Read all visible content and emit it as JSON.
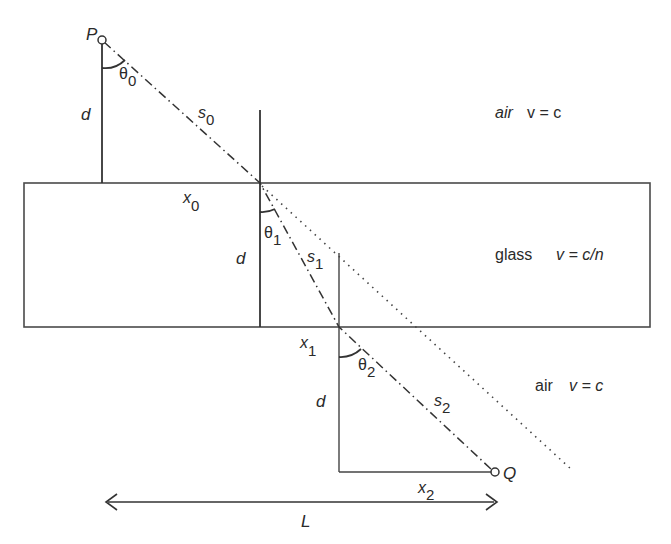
{
  "figure": {
    "points": {
      "source": "P",
      "destination": "Q"
    },
    "regions": [
      {
        "name": "air",
        "velocity": "v = c",
        "position": "top"
      },
      {
        "name": "glass",
        "velocity": "v = c/n",
        "position": "middle"
      },
      {
        "name": "air",
        "velocity": "v = c",
        "position": "bottom"
      }
    ],
    "angles": {
      "theta0": {
        "symbol": "θ",
        "sub": "0"
      },
      "theta1": {
        "symbol": "θ",
        "sub": "1"
      },
      "theta2": {
        "symbol": "θ",
        "sub": "2"
      }
    },
    "segments": {
      "s0": {
        "symbol": "s",
        "sub": "0"
      },
      "s1": {
        "symbol": "s",
        "sub": "1"
      },
      "s2": {
        "symbol": "s",
        "sub": "2"
      }
    },
    "horizontal_distances": {
      "x0": {
        "symbol": "x",
        "sub": "0"
      },
      "x1": {
        "symbol": "x",
        "sub": "1"
      },
      "x2": {
        "symbol": "x",
        "sub": "2"
      }
    },
    "thickness_label": "d",
    "total_length_label": "L"
  }
}
